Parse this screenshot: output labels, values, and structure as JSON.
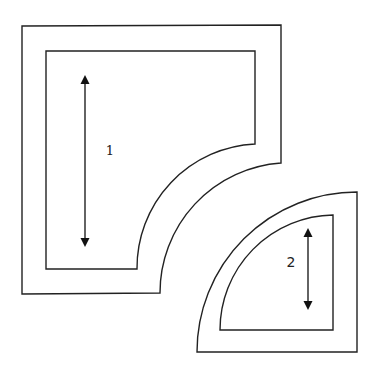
{
  "diagram": {
    "stroke_color": "#222222",
    "background": "#ffffff",
    "pieces": [
      {
        "id": "piece-1",
        "label": "1",
        "label_pos": {
          "x": 110,
          "y": 151
        },
        "arrow": {
          "x": 85,
          "y1": 75,
          "y2": 247,
          "direction": "double"
        },
        "outer_path": "M 22 26 L 281 25 L 281 163 A 130 130 0 0 0 160 293 L 22 294 Z",
        "inner_path": "M 46 51 L 255 51 L 255 144 A 124 124 0 0 0 137 269 L 46 269 Z"
      },
      {
        "id": "piece-2",
        "label": "2",
        "label_pos": {
          "x": 291,
          "y": 262
        },
        "arrow": {
          "x": 308,
          "y1": 228,
          "y2": 310,
          "direction": "double"
        },
        "outer_path": "M 197 352 A 160 160 0 0 1 357 192 L 357 352 Z",
        "inner_path": "M 220 330 A 115 115 0 0 1 333 215 L 333 330 Z"
      }
    ]
  }
}
